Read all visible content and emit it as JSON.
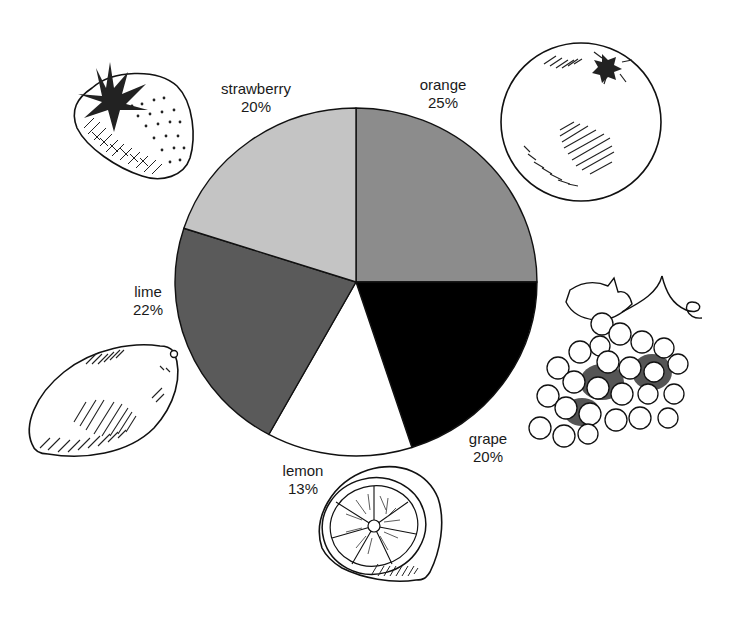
{
  "chart_data": {
    "type": "pie",
    "title": "",
    "start_angle_deg": 90,
    "direction": "clockwise",
    "categories": [
      "orange",
      "grape",
      "lemon",
      "lime",
      "strawberry"
    ],
    "values": [
      25,
      20,
      13,
      22,
      20
    ],
    "value_labels": [
      "25%",
      "20%",
      "13%",
      "22%",
      "20%"
    ],
    "colors": [
      "#8c8c8c",
      "#000000",
      "#ffffff",
      "#5a5a5a",
      "#c4c4c4"
    ],
    "legend": "none (labels placed next to slices with fruit illustrations)"
  },
  "labels": {
    "orange": {
      "name": "orange",
      "pct": "25%"
    },
    "grape": {
      "name": "grape",
      "pct": "20%"
    },
    "lemon": {
      "name": "lemon",
      "pct": "13%"
    },
    "lime": {
      "name": "lime",
      "pct": "22%"
    },
    "strawberry": {
      "name": "strawberry",
      "pct": "20%"
    }
  },
  "illustrations": [
    "strawberry-illustration",
    "orange-illustration",
    "grape-illustration",
    "lemon-half-illustration",
    "lime-illustration"
  ]
}
